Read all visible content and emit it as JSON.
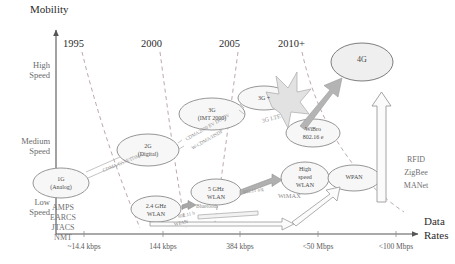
{
  "axes": {
    "y_title": "Mobility",
    "x_title_line1": "Data",
    "x_title_line2": "Rates",
    "y_ticks": [
      {
        "line1": "High",
        "line2": "Speed"
      },
      {
        "line1": "Medium",
        "line2": "Speed"
      },
      {
        "line1": "Low",
        "line2": "Speed"
      }
    ],
    "x_ticks": [
      "~14.4 kbps",
      "144 kbps",
      "384 kbps",
      "<50 Mbps",
      "<100 Mbps"
    ],
    "years": [
      "1995",
      "2000",
      "2005",
      "2010+"
    ]
  },
  "nodes": {
    "g1": {
      "line1": "1G",
      "line2": "(Analog)"
    },
    "g2": {
      "line1": "2G",
      "line2": "(Digital)"
    },
    "g3": {
      "line1": "3G",
      "line2": "(IMT 2000)"
    },
    "g3plus": {
      "line1": "3G +"
    },
    "g4": {
      "line1": "4G"
    },
    "wlan24": {
      "line1": "2.4 GHz",
      "line2": "WLAN"
    },
    "wlan5": {
      "line1": "5 GHz",
      "line2": "WLAN"
    },
    "hswlan": {
      "line1": "High",
      "line2": "speed",
      "line3": "WLAN"
    },
    "wibro": {
      "line1": "WiBro",
      "line2": "802.16 e"
    },
    "wpan": {
      "line1": "WPAN"
    }
  },
  "tech_labels": {
    "cdma_gsm_tdma": "CDMA/GSM/TDMA",
    "cdma2000_line1": "CDMA2000 EV DO/DV",
    "cdma2000_line2": "W-CDMA/HSDP",
    "lte": "3G LTE",
    "ieee80211b_line1": "802.11 b",
    "ieee80211b_line2": "WPAN",
    "ieee80211ag": "802.11 a/g",
    "bluetooth": "Bluetooth",
    "wimax": "WiMAX"
  },
  "legacy_list": {
    "items": [
      "AMPS",
      "EARCS",
      "JTACS",
      "NMT"
    ]
  },
  "emerging_list": {
    "items": [
      "RFID",
      "ZigBee",
      "MANet"
    ]
  },
  "colors": {
    "axis": "#555555",
    "node_stroke": "#8a8a8a",
    "node_fill": "#f7f7f7",
    "dashed": "#b9a8a8",
    "arrow_fill": "#d9d9d9",
    "arrow_stroke": "#9a9a9a",
    "text": "#4a4a4a"
  }
}
